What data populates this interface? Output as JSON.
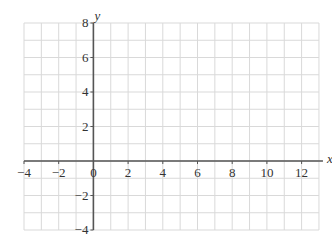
{
  "chart_data": {
    "type": "coordinate-grid",
    "title": "",
    "xlabel": "x",
    "ylabel": "y",
    "xlim": [
      -4,
      13
    ],
    "ylim": [
      -4,
      8
    ],
    "grid": true,
    "grid_step": 1,
    "x_ticks": [
      -4,
      -2,
      0,
      2,
      4,
      6,
      8,
      10,
      12
    ],
    "y_ticks": [
      -4,
      -2,
      2,
      4,
      6,
      8
    ],
    "origin_label": "0",
    "series": []
  },
  "colors": {
    "grid": "#d9d9d9",
    "axis": "#555555",
    "text": "#333333"
  }
}
